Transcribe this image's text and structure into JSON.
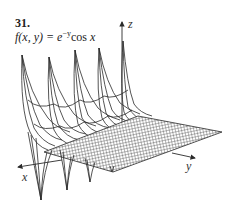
{
  "exercise": {
    "number": "31.",
    "function_lhs": "f(x, y) = ",
    "function_base": "e",
    "function_exp": "−y",
    "function_trig": "cos ",
    "function_var": "x"
  },
  "axes": {
    "x_label": "x",
    "y_label": "y",
    "z_label": "z"
  },
  "colors": {
    "line": "#2a2a2a",
    "background": "#ffffff"
  }
}
